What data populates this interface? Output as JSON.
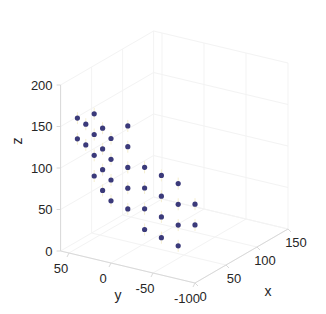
{
  "chart_data": {
    "type": "scatter",
    "dimensions": 3,
    "title": "",
    "xlabel": "x",
    "ylabel": "y",
    "zlabel": "z",
    "xlim": [
      0,
      150
    ],
    "ylim": [
      -100,
      60
    ],
    "zlim": [
      0,
      200
    ],
    "xticks": [
      "0",
      "50",
      "100",
      "150"
    ],
    "yticks": [
      "50",
      "0",
      "-50",
      "-100"
    ],
    "zticks": [
      "0",
      "50",
      "100",
      "150",
      "200"
    ],
    "marker_color": "#3b3a7a",
    "grid": true,
    "points": [
      {
        "x": 0,
        "y": 20,
        "z": 175
      },
      {
        "x": 0,
        "y": 20,
        "z": 150
      },
      {
        "x": 0,
        "y": 20,
        "z": 125
      },
      {
        "x": 0,
        "y": 20,
        "z": 100
      },
      {
        "x": 0,
        "y": 40,
        "z": 165
      },
      {
        "x": 0,
        "y": 40,
        "z": 140
      },
      {
        "x": 0,
        "y": 30,
        "z": 160
      },
      {
        "x": 0,
        "y": 30,
        "z": 135
      },
      {
        "x": 0,
        "y": 10,
        "z": 160
      },
      {
        "x": 0,
        "y": 10,
        "z": 135
      },
      {
        "x": 0,
        "y": 10,
        "z": 110
      },
      {
        "x": 0,
        "y": 10,
        "z": 85
      },
      {
        "x": 0,
        "y": 0,
        "z": 150
      },
      {
        "x": 0,
        "y": 0,
        "z": 125
      },
      {
        "x": 0,
        "y": 0,
        "z": 100
      },
      {
        "x": 0,
        "y": 0,
        "z": 75
      },
      {
        "x": 0,
        "y": -20,
        "z": 170
      },
      {
        "x": 0,
        "y": -20,
        "z": 145
      },
      {
        "x": 0,
        "y": -20,
        "z": 120
      },
      {
        "x": 0,
        "y": -20,
        "z": 95
      },
      {
        "x": 0,
        "y": -20,
        "z": 70
      },
      {
        "x": 0,
        "y": -40,
        "z": 125
      },
      {
        "x": 0,
        "y": -40,
        "z": 100
      },
      {
        "x": 0,
        "y": -40,
        "z": 75
      },
      {
        "x": 0,
        "y": -40,
        "z": 50
      },
      {
        "x": 0,
        "y": -60,
        "z": 120
      },
      {
        "x": 0,
        "y": -60,
        "z": 95
      },
      {
        "x": 0,
        "y": -60,
        "z": 70
      },
      {
        "x": 0,
        "y": -60,
        "z": 45
      },
      {
        "x": 0,
        "y": -80,
        "z": 115
      },
      {
        "x": 0,
        "y": -80,
        "z": 90
      },
      {
        "x": 0,
        "y": -80,
        "z": 65
      },
      {
        "x": 0,
        "y": -80,
        "z": 40
      },
      {
        "x": 0,
        "y": -100,
        "z": 95
      },
      {
        "x": 0,
        "y": -100,
        "z": 70
      }
    ]
  }
}
